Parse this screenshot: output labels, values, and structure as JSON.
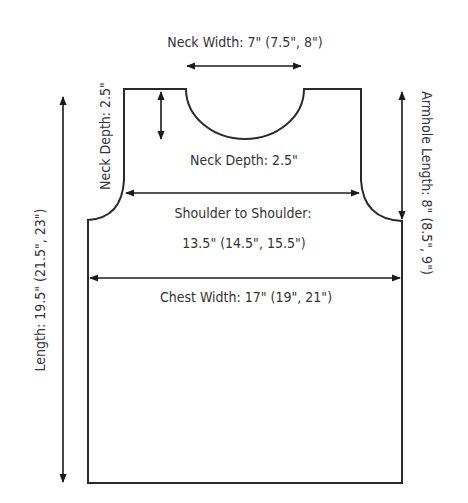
{
  "diagram": {
    "colors": {
      "line": "#2a2a2a",
      "text": "#333333",
      "background": "#ffffff"
    },
    "labels": {
      "neck_width": "Neck Width: 7\" (7.5\", 8\")",
      "neck_depth_inner": "Neck Depth: 2.5\"",
      "neck_depth_side": "Neck Depth: 2.5\"",
      "shoulder_line1": "Shoulder to Shoulder:",
      "shoulder_line2": "13.5\" (14.5\", 15.5\")",
      "chest_width": "Chest Width: 17\" (19\", 21\")",
      "length": "Length: 19.5\" (21.5\", 23\")",
      "armhole_length": "Armhole Length: 8\" (8.5\", 9\")"
    },
    "measurements": [
      {
        "name": "Neck Width",
        "values": [
          "7\"",
          "7.5\"",
          "8\""
        ]
      },
      {
        "name": "Neck Depth",
        "values": [
          "2.5\""
        ]
      },
      {
        "name": "Shoulder to Shoulder",
        "values": [
          "13.5\"",
          "14.5\"",
          "15.5\""
        ]
      },
      {
        "name": "Chest Width",
        "values": [
          "17\"",
          "19\"",
          "21\""
        ]
      },
      {
        "name": "Length",
        "values": [
          "19.5\"",
          "21.5\"",
          "23\""
        ]
      },
      {
        "name": "Armhole Length",
        "values": [
          "8\"",
          "8.5\"",
          "9\""
        ]
      }
    ]
  }
}
